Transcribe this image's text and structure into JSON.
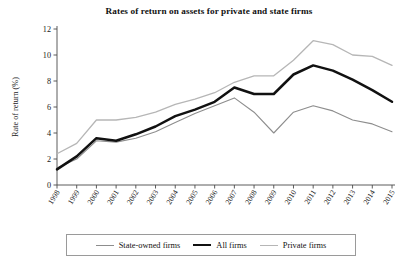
{
  "chart_data": {
    "type": "line",
    "title": "Rates of return on assets for private and state firms",
    "xlabel": "",
    "ylabel": "Rate of return (%)",
    "categories": [
      "1998",
      "1999",
      "2000",
      "2001",
      "2002",
      "2003",
      "2004",
      "2005",
      "2006",
      "2007",
      "2008",
      "2009",
      "2010",
      "2011",
      "2012",
      "2013",
      "2014",
      "2015"
    ],
    "x": [
      1998,
      1999,
      2000,
      2001,
      2002,
      2003,
      2004,
      2005,
      2006,
      2007,
      2008,
      2009,
      2010,
      2011,
      2012,
      2013,
      2014,
      2015
    ],
    "ylim": [
      0,
      12
    ],
    "yticks": [
      0,
      2,
      4,
      6,
      8,
      10,
      12
    ],
    "grid": false,
    "legend_position": "bottom",
    "series": [
      {
        "name": "State-owned firms",
        "color": "#8d8d8d",
        "width": 1.1,
        "values": [
          1.3,
          2.0,
          3.4,
          3.3,
          3.6,
          4.1,
          4.8,
          5.5,
          6.1,
          6.7,
          5.6,
          4.0,
          5.6,
          6.1,
          5.7,
          5.0,
          4.7,
          4.1
        ]
      },
      {
        "name": "All firms",
        "color": "#111111",
        "width": 2.5,
        "values": [
          1.2,
          2.2,
          3.6,
          3.4,
          3.9,
          4.5,
          5.3,
          5.8,
          6.4,
          7.5,
          7.0,
          7.0,
          8.5,
          9.2,
          8.8,
          8.1,
          7.3,
          6.4
        ]
      },
      {
        "name": "Private firms",
        "color": "#b6b6b6",
        "width": 1.3,
        "values": [
          2.4,
          3.2,
          5.0,
          5.0,
          5.2,
          5.6,
          6.2,
          6.6,
          7.1,
          7.9,
          8.4,
          8.4,
          9.6,
          11.1,
          10.8,
          10.0,
          9.9,
          9.2
        ]
      }
    ]
  },
  "legend": {
    "items": [
      {
        "label": "State-owned firms",
        "key": "state"
      },
      {
        "label": "All firms",
        "key": "all"
      },
      {
        "label": "Private firms",
        "key": "private"
      }
    ]
  }
}
